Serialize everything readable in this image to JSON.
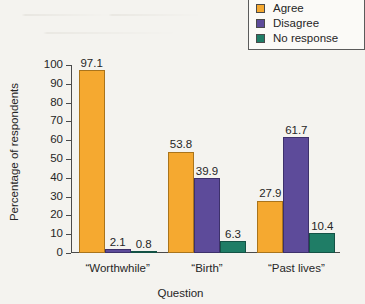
{
  "chart_data": {
    "type": "bar",
    "title": "",
    "xlabel": "Question",
    "ylabel": "Percentage of respondents",
    "categories": [
      "“Worthwhile”",
      "“Birth”",
      "“Past lives”"
    ],
    "series": [
      {
        "name": "Agree",
        "color": "#f5a930",
        "values": [
          97.1,
          53.8,
          27.9
        ]
      },
      {
        "name": "Disagree",
        "color": "#5d4b9a",
        "values": [
          2.1,
          39.9,
          61.7
        ]
      },
      {
        "name": "No response",
        "color": "#1f7d66",
        "values": [
          0.8,
          6.3,
          10.4
        ]
      }
    ],
    "ylim": [
      0,
      100
    ],
    "yticks": [
      0,
      10,
      20,
      30,
      40,
      50,
      60,
      70,
      80,
      90,
      100
    ],
    "ytick_labels": [
      "0",
      "10",
      "20",
      "30",
      "40",
      "50",
      "60",
      "70",
      "80",
      "90",
      "100"
    ],
    "grid": false,
    "legend_position": "top-right",
    "data_labels": true,
    "data_label_values": [
      [
        "97.1",
        "2.1",
        "0.8"
      ],
      [
        "53.8",
        "39.9",
        "6.3"
      ],
      [
        "27.9",
        "61.7",
        "10.4"
      ]
    ]
  },
  "legend": {
    "entries": [
      {
        "label": "Agree",
        "swatch": "legend-swatch-agree"
      },
      {
        "label": "Disagree",
        "swatch": "legend-swatch-disagree"
      },
      {
        "label": "No response",
        "swatch": "legend-swatch-no-response"
      }
    ]
  }
}
